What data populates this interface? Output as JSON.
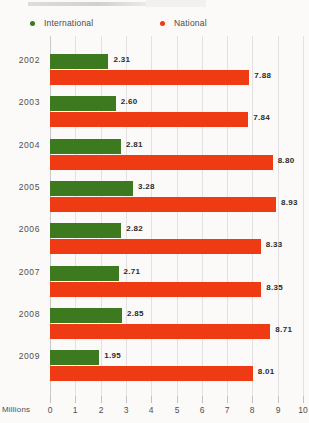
{
  "legend": {
    "items": [
      {
        "label": "International",
        "color": "#3d7a1f",
        "marker": "legend-dot-international"
      },
      {
        "label": "National",
        "color": "#ee3b13",
        "marker": "legend-dot-national"
      }
    ]
  },
  "axis": {
    "title": "Millions",
    "ticks": [
      "0",
      "1",
      "2",
      "3",
      "4",
      "5",
      "6",
      "7",
      "8",
      "9",
      "10"
    ]
  },
  "chart_data": {
    "type": "bar",
    "orientation": "horizontal",
    "title": "",
    "subtitle": "",
    "xlabel": "Millions",
    "ylabel": "",
    "xlim": [
      0,
      10
    ],
    "grid": true,
    "legend_position": "top",
    "categories": [
      "2002",
      "2003",
      "2004",
      "2005",
      "2006",
      "2007",
      "2008",
      "2009"
    ],
    "series": [
      {
        "name": "International",
        "color": "#3d7a1f",
        "values": [
          2.31,
          2.6,
          2.81,
          3.28,
          2.82,
          2.71,
          2.85,
          1.95
        ],
        "labels": [
          "2.31",
          "2.60",
          "2.81",
          "3.28",
          "2.82",
          "2.71",
          "2.85",
          "1.95"
        ]
      },
      {
        "name": "National",
        "color": "#ee3b13",
        "values": [
          7.88,
          7.84,
          8.8,
          8.93,
          8.33,
          8.35,
          8.71,
          8.01
        ],
        "labels": [
          "7.88",
          "7.84",
          "8.80",
          "8.93",
          "8.33",
          "8.35",
          "8.71",
          "8.01"
        ]
      }
    ]
  }
}
